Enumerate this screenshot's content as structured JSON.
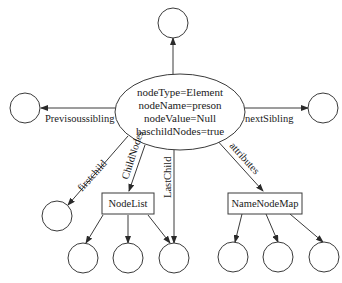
{
  "diagram": {
    "center_node": {
      "lines": [
        "nodeType=Element",
        "nodeName=preson",
        "nodeValue=Null",
        "haschildNodes=true"
      ]
    },
    "edges": {
      "parent": "",
      "previous_sibling": "Previsoussibling",
      "next_sibling": "nextSibling",
      "first_child": "firstchild",
      "child_nodes": "ChildNodes",
      "last_child": "LastChild",
      "attributes": "attributes"
    },
    "boxes": {
      "node_list": "NodeList",
      "name_node_map": "NameNodeMap"
    },
    "colors": {
      "stroke": "#3a3a3a",
      "text": "#1a1a1a",
      "background": "#ffffff"
    }
  }
}
